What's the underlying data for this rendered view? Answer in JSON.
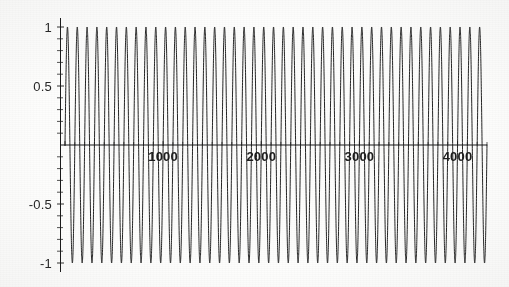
{
  "chart_data": {
    "type": "line",
    "title": "",
    "subtitle": "",
    "xlabel": "",
    "ylabel": "",
    "xlim": [
      0,
      4300
    ],
    "ylim": [
      -1.08,
      1.08
    ],
    "grid": false,
    "legend": null,
    "series": [
      {
        "name": "oscillation",
        "color": "#1a1a1a",
        "amplitude": 1,
        "period": 100,
        "phase": 0,
        "samples": 4300
      }
    ],
    "x_ticks": [
      {
        "value": 1000,
        "label": "1000"
      },
      {
        "value": 2000,
        "label": "2000"
      },
      {
        "value": 3000,
        "label": "3000"
      },
      {
        "value": 4000,
        "label": "4000"
      }
    ],
    "y_ticks": [
      {
        "value": 1,
        "label": "1"
      },
      {
        "value": 0.5,
        "label": "0.5"
      },
      {
        "value": -0.5,
        "label": "-0.5"
      },
      {
        "value": -1,
        "label": "-1"
      }
    ],
    "y_minor_tick_step": 0.1,
    "axis_color": "#1a1a1a",
    "background_color": "#fdfdfc"
  },
  "geometry": {
    "width": 509,
    "height": 287,
    "origin_x": 65,
    "axis_x": 60,
    "axis_y": 145,
    "right_edge": 487,
    "px_per_1000": 100,
    "px_per_unit_y": 118
  }
}
